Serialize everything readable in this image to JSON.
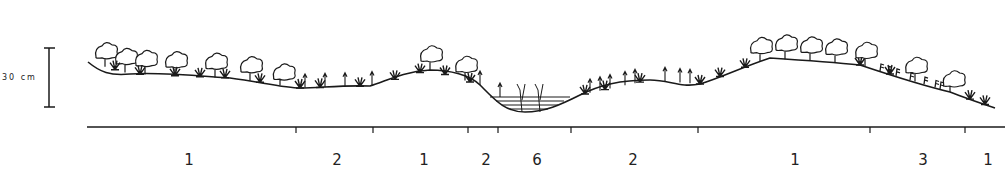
{
  "scale_bar": {
    "label": "30 cm"
  },
  "zones": [
    {
      "code": "1",
      "type": "shrub"
    },
    {
      "code": "2",
      "type": "grass"
    },
    {
      "code": "1",
      "type": "shrub"
    },
    {
      "code": "2",
      "type": "grass"
    },
    {
      "code": "6",
      "type": "water"
    },
    {
      "code": "2",
      "type": "grass"
    },
    {
      "code": "1",
      "type": "shrub"
    },
    {
      "code": "3",
      "type": "fern"
    },
    {
      "code": "1",
      "type": "shrub"
    }
  ],
  "colors": {
    "ink": "#1a1a1a",
    "paper": "#ffffff"
  }
}
